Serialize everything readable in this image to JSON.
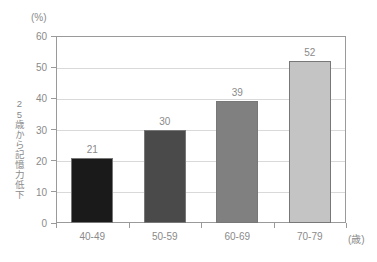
{
  "chart_data": {
    "type": "bar",
    "title": "",
    "categories": [
      "40-49",
      "50-59",
      "60-69",
      "70-79"
    ],
    "values": [
      21,
      30,
      39,
      52
    ],
    "value_labels": [
      "21",
      "30",
      "39",
      "52"
    ],
    "bar_colors": [
      "#1a1a1a",
      "#4a4a4a",
      "#808080",
      "#c4c4c4"
    ],
    "bar_border_color": "#777777",
    "xlabel": "",
    "x_unit": "(歳)",
    "ylabel": "25歳から記憶力低下",
    "y_unit": "(%)",
    "ylim": [
      0,
      60
    ],
    "ytick_values": [
      0,
      10,
      20,
      30,
      40,
      50,
      60
    ],
    "ytick_labels": [
      "0",
      "10",
      "20",
      "30",
      "40",
      "50",
      "60"
    ],
    "grid": true,
    "grid_color": "#d9d9d9",
    "legend": null,
    "legend_position": "none",
    "axis_color": "#9a9a9a",
    "text_color": "#8a8a8a",
    "background": "#ffffff"
  }
}
